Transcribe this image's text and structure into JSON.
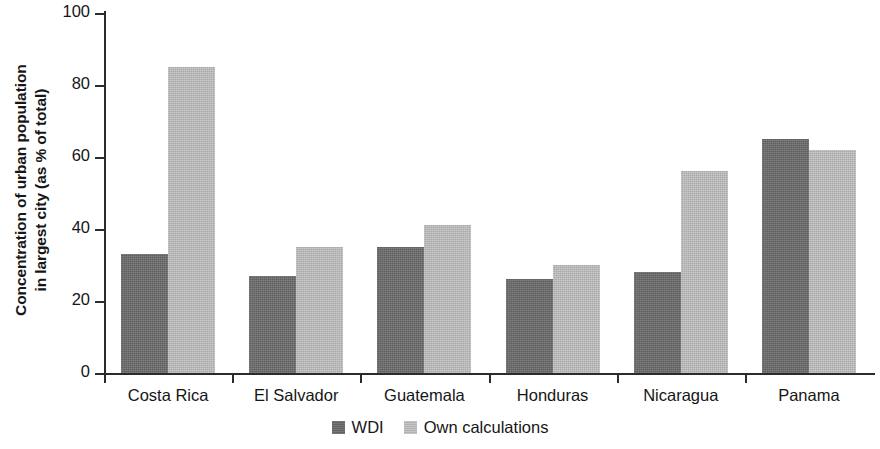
{
  "chart_data": {
    "type": "bar",
    "title": "",
    "subtitle": "",
    "xlabel": "",
    "ylabel_line1": "Concentration of urban population",
    "ylabel_line2": "in largest city (as % of total)",
    "categories": [
      "Costa Rica",
      "El Salvador",
      "Guatemala",
      "Honduras",
      "Nicaragua",
      "Panama"
    ],
    "series": [
      {
        "name": "WDI",
        "color": "#6c6c6c",
        "values": [
          33,
          27,
          35,
          26,
          28,
          65
        ]
      },
      {
        "name": "Own calculations",
        "color": "#bebebe",
        "values": [
          85,
          35,
          41,
          30,
          56,
          62
        ]
      }
    ],
    "ylim": [
      0,
      100
    ],
    "yticks": [
      0,
      20,
      40,
      60,
      80,
      100
    ],
    "ytick_labels": [
      "0",
      "20",
      "40",
      "60",
      "80",
      "100"
    ],
    "grid": false,
    "legend_position": "bottom-center",
    "axis_color": "#2b2b2b"
  }
}
